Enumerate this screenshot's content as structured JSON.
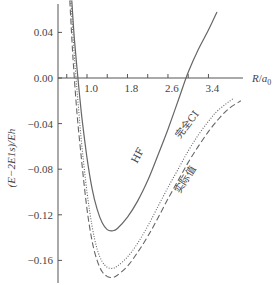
{
  "chart_data": {
    "type": "line",
    "title": "",
    "xlabel": "R/a0",
    "ylabel": "(E−2E1s)/Eh",
    "xlim": [
      0.42,
      4.1
    ],
    "ylim": [
      -0.185,
      0.068
    ],
    "grid": false,
    "legend": "inline labels on curves",
    "x_ticks": [
      1.0,
      1.8,
      2.6,
      3.4
    ],
    "x_tick_labels": [
      "1.0",
      "1.8",
      "2.6",
      "3.4"
    ],
    "x_minor_ticks": [
      0.6,
      1.0,
      1.4,
      1.8,
      2.2,
      2.6,
      3.0,
      3.4
    ],
    "y_ticks": [
      0.04,
      0.0,
      -0.04,
      -0.08,
      -0.12,
      -0.16
    ],
    "y_tick_labels": [
      "0.04",
      "0.00",
      "−0.04",
      "−0.08",
      "−0.12",
      "−0.16"
    ],
    "series": [
      {
        "name": "HF",
        "style": "solid",
        "x": [
          0.7,
          0.75,
          0.82,
          0.9,
          1.0,
          1.1,
          1.2,
          1.3,
          1.4,
          1.5,
          1.6,
          1.8,
          2.0,
          2.2,
          2.4,
          2.6,
          2.8,
          3.0,
          3.2,
          3.4,
          3.57
        ],
        "y": [
          0.068,
          0.035,
          0.0,
          -0.035,
          -0.07,
          -0.097,
          -0.115,
          -0.127,
          -0.133,
          -0.134,
          -0.132,
          -0.122,
          -0.108,
          -0.09,
          -0.068,
          -0.045,
          -0.02,
          0.005,
          0.025,
          0.042,
          0.058
        ]
      },
      {
        "name": "完全CI",
        "style": "dotted",
        "x": [
          0.68,
          0.75,
          0.82,
          0.9,
          1.0,
          1.1,
          1.2,
          1.3,
          1.4,
          1.5,
          1.6,
          1.8,
          2.0,
          2.2,
          2.4,
          2.6,
          2.8,
          3.0,
          3.2,
          3.4,
          3.6,
          3.89
        ],
        "y": [
          0.068,
          0.02,
          -0.02,
          -0.06,
          -0.1,
          -0.13,
          -0.15,
          -0.161,
          -0.166,
          -0.167,
          -0.165,
          -0.157,
          -0.145,
          -0.13,
          -0.113,
          -0.096,
          -0.08,
          -0.064,
          -0.05,
          -0.038,
          -0.028,
          -0.018
        ]
      },
      {
        "name": "实际值",
        "style": "dashed",
        "x": [
          0.66,
          0.72,
          0.8,
          0.9,
          1.0,
          1.1,
          1.2,
          1.3,
          1.4,
          1.5,
          1.6,
          1.8,
          2.0,
          2.2,
          2.4,
          2.6,
          2.8,
          3.0,
          3.2,
          3.4,
          3.6,
          3.8,
          4.04
        ],
        "y": [
          0.068,
          0.02,
          -0.03,
          -0.075,
          -0.115,
          -0.143,
          -0.16,
          -0.17,
          -0.174,
          -0.175,
          -0.173,
          -0.165,
          -0.153,
          -0.139,
          -0.123,
          -0.106,
          -0.09,
          -0.074,
          -0.06,
          -0.047,
          -0.036,
          -0.027,
          -0.02
        ]
      }
    ],
    "annotations": [
      {
        "text": "HF",
        "near_series": "HF"
      },
      {
        "text": "完全CI",
        "near_series": "完全CI"
      },
      {
        "text": "实际值",
        "near_series": "实际值"
      }
    ]
  },
  "labels": {
    "xlabel_main": "R",
    "xlabel_sep": "/",
    "xlabel_a": "a",
    "xlabel_sub": "0",
    "ylabel": "(E−2E1s)/Eh",
    "hf": "HF",
    "fullci": "完全CI",
    "actual": "实际值"
  },
  "colors": {
    "axis": "#555555",
    "curve": "#666666",
    "text": "#444444"
  }
}
